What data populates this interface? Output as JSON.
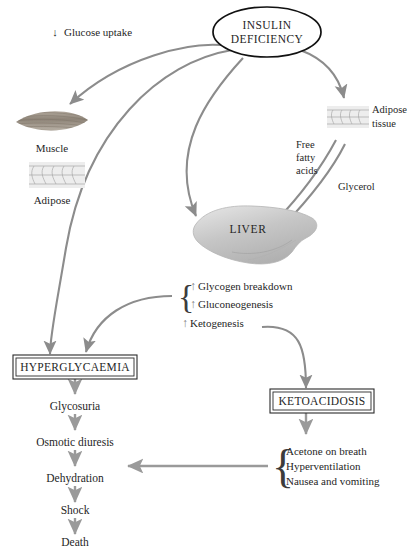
{
  "diagram": {
    "center_node": {
      "line1": "INSULIN",
      "line2": "DEFICIENCY"
    },
    "glucose_uptake": {
      "arrow": "↓",
      "label": "Glucose uptake"
    },
    "tissues": {
      "muscle_label": "Muscle",
      "adipose_label": "Adipose",
      "adipose_tissue_line1": "Adipose",
      "adipose_tissue_line2": "tissue"
    },
    "substrates": {
      "ffa_line1": "Free",
      "ffa_line2": "fatty",
      "ffa_line3": "acids",
      "glycerol": "Glycerol"
    },
    "liver": {
      "label": "LIVER"
    },
    "liver_processes": {
      "braced": [
        {
          "arrow": "↑",
          "label": "Glycogen breakdown"
        },
        {
          "arrow": "↑",
          "label": "Gluconeogenesis"
        }
      ],
      "separate": {
        "arrow": "↑",
        "label": "Ketogenesis"
      },
      "brace_glyph": "{"
    },
    "hyperglycaemia": {
      "label": "HYPERGLYCAEMIA"
    },
    "ketoacidosis": {
      "label": "KETOACIDOSIS"
    },
    "cascade": [
      "Glycosuria",
      "Osmotic diuresis",
      "Dehydration",
      "Shock",
      "Death"
    ],
    "symptoms": {
      "brace_glyph": "{",
      "items": [
        "Acetone on breath",
        "Hyperventilation",
        "Nausea and vomiting"
      ]
    },
    "colors": {
      "arrow": "#8c8c8c",
      "outline": "#111111",
      "text": "#262626",
      "muscle": "#9c9286",
      "adipose": "#d9d9d9",
      "liver": "#c9c9c9"
    }
  }
}
